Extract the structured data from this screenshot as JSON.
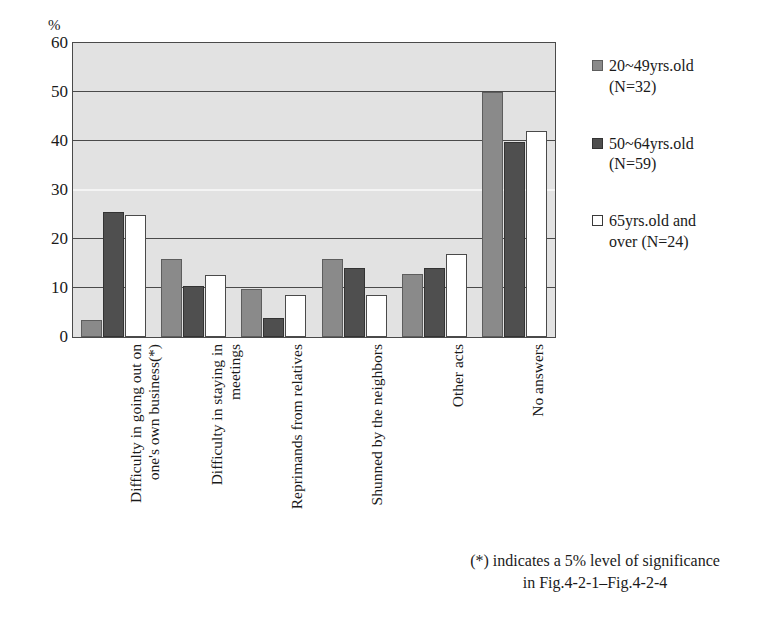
{
  "axis_unit_label": "%",
  "footnote": "(*) indicates a 5% level of significance\nin Fig.4-2-1–Fig.4-2-4",
  "legend": {
    "items": [
      {
        "label": "20~49yrs.old\n(N=32)",
        "color": "#8a8a8a",
        "swatch_name": "legend-swatch-20-49"
      },
      {
        "label": "50~64yrs.old\n(N=59)",
        "color": "#4f4f4f",
        "swatch_name": "legend-swatch-50-64"
      },
      {
        "label": "65yrs.old and\nover (N=24)",
        "color": "#ffffff",
        "swatch_name": "legend-swatch-65-over"
      }
    ]
  },
  "chart_data": {
    "type": "bar",
    "title": "",
    "xlabel": "",
    "ylabel": "%",
    "ylim": [
      0,
      60
    ],
    "yticks": [
      0,
      10,
      20,
      30,
      40,
      50,
      60
    ],
    "grid": true,
    "legend_position": "right",
    "categories": [
      "Difficulty in going out on\none's own business(*)",
      "Difficulty in staying in\nmeetings",
      "Reprimands from relatives",
      "Shunned by the neighbors",
      "Other acts",
      "No answers"
    ],
    "series": [
      {
        "name": "20~49yrs.old (N=32)",
        "color": "#8a8a8a",
        "values": [
          3.5,
          15.9,
          9.8,
          15.9,
          12.9,
          50.0
        ]
      },
      {
        "name": "50~64yrs.old (N=59)",
        "color": "#4f4f4f",
        "values": [
          25.6,
          10.5,
          3.8,
          14.0,
          14.0,
          39.8
        ]
      },
      {
        "name": "65yrs.old and over (N=24)",
        "color": "#ffffff",
        "values": [
          25.0,
          12.7,
          8.6,
          8.6,
          17.0,
          42.0
        ]
      }
    ]
  }
}
